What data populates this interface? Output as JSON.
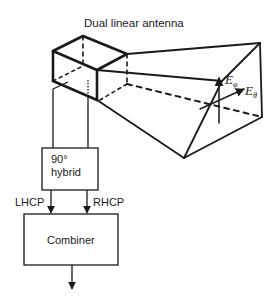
{
  "diagram": {
    "title": "Dual linear antenna",
    "hybrid": {
      "line1": "90°",
      "line2": "hybrid"
    },
    "ports": {
      "left": "LHCP",
      "right": "RHCP"
    },
    "combiner": "Combiner",
    "fields": {
      "e_phi": {
        "base": "E",
        "sub": "φ"
      },
      "e_theta": {
        "base": "E",
        "sub": "θ"
      }
    },
    "colors": {
      "stroke": "#1a1a1a",
      "background": "#ffffff"
    }
  }
}
